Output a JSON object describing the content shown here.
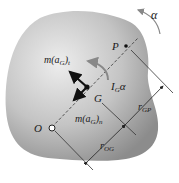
{
  "diagram": {
    "type": "rigid-body kinetics free-body diagram",
    "labels": {
      "alpha": "α",
      "point_p": "P",
      "point_g": "G",
      "point_o": "O",
      "tangential_force": "m(a",
      "tangential_sub": "G",
      "tangential_end": ")",
      "tangential_tsub": "t",
      "normal_force": "m(a",
      "normal_sub": "G",
      "normal_end": ")",
      "normal_nsub": "n",
      "moment_I": "I",
      "moment_sub": "G",
      "moment_alpha": "α",
      "r_gp": "r",
      "r_gp_sub": "GP",
      "r_og": "r",
      "r_og_sub": "OG"
    },
    "colors": {
      "body_light": "#e6e6e6",
      "body_dark": "#9a9a9a",
      "ink": "#111111",
      "curve_arrow": "#8a8a8a"
    }
  }
}
